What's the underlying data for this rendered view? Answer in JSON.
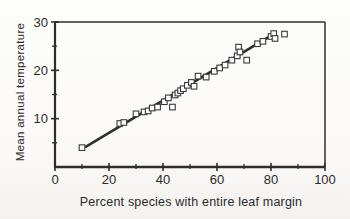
{
  "chart_data": {
    "type": "scatter",
    "title": "",
    "xlabel": "Percent species with entire leaf margin",
    "ylabel": "Mean annual temperature",
    "xlim": [
      0,
      100
    ],
    "ylim": [
      0,
      30
    ],
    "x_major_ticks": [
      0,
      20,
      40,
      60,
      80,
      100
    ],
    "x_minor_ticks": [
      10,
      30,
      50,
      70,
      90
    ],
    "y_major_ticks": [
      10,
      20,
      30
    ],
    "y_minor_ticks": [
      5,
      15,
      25
    ],
    "grid": false,
    "legend": false,
    "marker": "open-square",
    "series": [
      {
        "name": "sites",
        "points": [
          [
            10,
            4.0
          ],
          [
            24,
            9.0
          ],
          [
            25.5,
            9.2
          ],
          [
            30,
            11.0
          ],
          [
            33,
            11.4
          ],
          [
            34.5,
            11.6
          ],
          [
            36,
            12.2
          ],
          [
            38,
            12.4
          ],
          [
            40.5,
            13.5
          ],
          [
            42,
            14.3
          ],
          [
            43.5,
            12.4
          ],
          [
            44.5,
            14.9
          ],
          [
            45.5,
            15.3
          ],
          [
            46.5,
            15.8
          ],
          [
            47.5,
            16.2
          ],
          [
            49,
            16.9
          ],
          [
            50.5,
            17.5
          ],
          [
            51.5,
            16.7
          ],
          [
            53,
            18.8
          ],
          [
            56,
            18.6
          ],
          [
            59,
            19.8
          ],
          [
            61,
            20.5
          ],
          [
            63,
            21.1
          ],
          [
            65.5,
            22.1
          ],
          [
            67.5,
            23.0
          ],
          [
            68,
            24.8
          ],
          [
            68.5,
            23.8
          ],
          [
            71,
            22.1
          ],
          [
            75,
            25.5
          ],
          [
            77,
            26.0
          ],
          [
            80,
            27.0
          ],
          [
            81,
            27.6
          ],
          [
            81.5,
            26.6
          ],
          [
            85,
            27.5
          ]
        ]
      }
    ],
    "trendline": {
      "x1": 11.5,
      "y1": 4.2,
      "x2": 80.3,
      "y2": 27.3
    },
    "colors": {
      "ink": "#2e2e2e",
      "marker_stroke": "#3a3a3a",
      "marker_fill": "#ffffff",
      "text": "#2a2a2a",
      "background": "#fbfbf9"
    }
  }
}
